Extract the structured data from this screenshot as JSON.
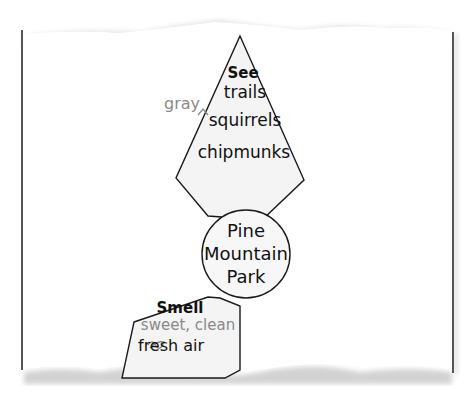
{
  "diagram": {
    "type": "sensory-web",
    "center": {
      "lines": [
        "Pine",
        "Mountain",
        "Park"
      ]
    },
    "nodes": [
      {
        "heading": "See",
        "items": [
          "trails",
          "squirrels",
          "chipmunks"
        ],
        "insertion": {
          "text": "gray",
          "caret_before": "squirrels"
        }
      },
      {
        "heading": "Smell",
        "items": [
          "sweet, clean",
          "fresh air"
        ],
        "revision_note": "\"sweet, clean\" written in gray above \"fresh air\"; letters in \"fresh\" partially scribbled"
      }
    ],
    "colors": {
      "line": "#1a1a1a",
      "shape_fill": "#f4f4f4",
      "revision_text": "#8a8a8a",
      "page_border": "#555555"
    }
  }
}
